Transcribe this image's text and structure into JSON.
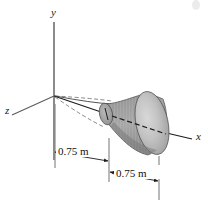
{
  "figure": {
    "background_color": "#ffffff",
    "axes": [
      {
        "id": "y",
        "label": "y",
        "label_x": 51,
        "label_y": 16,
        "orientation": "vertical-up"
      },
      {
        "id": "z",
        "label": "z",
        "label_x": 6,
        "label_y": 112,
        "orientation": "lower-left"
      },
      {
        "id": "x",
        "label": "x",
        "label_x": 196,
        "label_y": 137,
        "orientation": "lower-right"
      }
    ],
    "dimensions": [
      {
        "id": "dim-left",
        "label": "0.75 m",
        "label_x": 58,
        "label_y": 155,
        "from_x": 55,
        "to_x": 108,
        "line_y": 152
      },
      {
        "id": "dim-right",
        "label": "0.75 m",
        "label_x": 118,
        "label_y": 177,
        "from_x": 110,
        "to_x": 160,
        "line_y": 174
      }
    ],
    "solid": {
      "name": "horn-solid-of-revolution",
      "axis": "x",
      "fill_body": "#9a9a9a",
      "fill_cap": "#b5b5b5",
      "fill_throat": "#8f8f8f",
      "outline_color": "#4a4a4a"
    },
    "colors": {
      "axis_gray": "#6e6e6e",
      "line_black": "#1c1c1c",
      "extension_gray": "#8a8a8a",
      "text_black": "#111111"
    }
  }
}
